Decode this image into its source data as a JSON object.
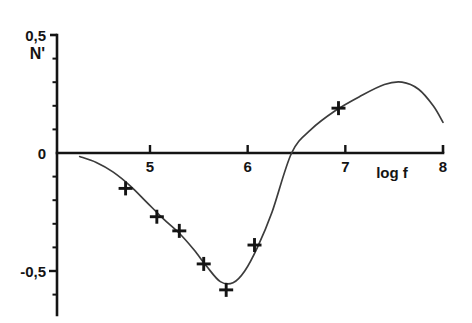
{
  "chart_data": {
    "type": "scatter",
    "title": "",
    "subtitle": "",
    "xlabel": "log f",
    "ylabel": "N'",
    "xlim": [
      4.0,
      8.0
    ],
    "ylim": [
      -0.72,
      0.5
    ],
    "grid": false,
    "legend": null,
    "x_ticks": [
      {
        "value": 5,
        "label": "5"
      },
      {
        "value": 6,
        "label": "6"
      },
      {
        "value": 7,
        "label": "7"
      },
      {
        "value": 8,
        "label": "8"
      }
    ],
    "y_ticks": [
      {
        "value": 0.5,
        "label": "0,5"
      },
      {
        "value": 0.0,
        "label": "0"
      },
      {
        "value": -0.5,
        "label": "-0,5"
      }
    ],
    "y_minor_ticks": [
      0.4,
      0.3,
      0.2,
      0.1,
      -0.1,
      -0.2,
      -0.3,
      -0.4,
      -0.6,
      -0.7
    ],
    "decimal_separator": ",",
    "marker": "plus",
    "marker_color": "#141414",
    "line_color": "#3c3c3c",
    "axis_color": "#141414",
    "series": [
      {
        "name": "measured",
        "type": "scatter",
        "marker": "plus",
        "points": [
          {
            "x": 4.75,
            "y": -0.15
          },
          {
            "x": 5.07,
            "y": -0.27
          },
          {
            "x": 5.3,
            "y": -0.33
          },
          {
            "x": 5.55,
            "y": -0.47
          },
          {
            "x": 5.78,
            "y": -0.58
          },
          {
            "x": 6.07,
            "y": -0.39
          },
          {
            "x": 6.93,
            "y": 0.19
          }
        ]
      },
      {
        "name": "fitted-curve",
        "type": "line",
        "points": [
          {
            "x": 4.28,
            "y": -0.015
          },
          {
            "x": 4.45,
            "y": -0.04
          },
          {
            "x": 4.62,
            "y": -0.08
          },
          {
            "x": 4.8,
            "y": -0.14
          },
          {
            "x": 4.97,
            "y": -0.21
          },
          {
            "x": 5.14,
            "y": -0.28
          },
          {
            "x": 5.3,
            "y": -0.34
          },
          {
            "x": 5.45,
            "y": -0.41
          },
          {
            "x": 5.58,
            "y": -0.48
          },
          {
            "x": 5.72,
            "y": -0.545
          },
          {
            "x": 5.85,
            "y": -0.55
          },
          {
            "x": 5.97,
            "y": -0.5
          },
          {
            "x": 6.1,
            "y": -0.4
          },
          {
            "x": 6.25,
            "y": -0.25
          },
          {
            "x": 6.45,
            "y": 0.0
          },
          {
            "x": 6.65,
            "y": 0.1
          },
          {
            "x": 6.9,
            "y": 0.18
          },
          {
            "x": 7.15,
            "y": 0.24
          },
          {
            "x": 7.4,
            "y": 0.29
          },
          {
            "x": 7.58,
            "y": 0.3
          },
          {
            "x": 7.75,
            "y": 0.27
          },
          {
            "x": 7.9,
            "y": 0.2
          },
          {
            "x": 8.0,
            "y": 0.13
          }
        ]
      }
    ]
  }
}
